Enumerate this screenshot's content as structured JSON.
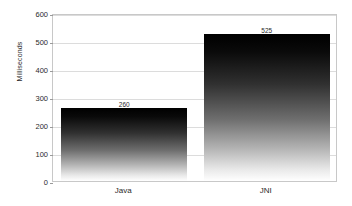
{
  "chart_data": {
    "type": "bar",
    "title": "",
    "subtitle": "",
    "xlabel": "",
    "ylabel": "Milliseconds",
    "categories": [
      "Java",
      "JNI"
    ],
    "values": [
      260,
      525
    ],
    "data_labels": [
      "260",
      "525"
    ],
    "ylim": [
      0,
      600
    ],
    "yticks": [
      0,
      100,
      200,
      300,
      400,
      500,
      600
    ],
    "ytick_labels": [
      "0",
      "100",
      "200",
      "300",
      "400",
      "500",
      "600"
    ],
    "grid": "horizontal",
    "legend": "none",
    "series": [
      {
        "name": "Milliseconds",
        "values": [
          260,
          525
        ]
      }
    ],
    "bar_style": {
      "fill": "vertical-gradient-black-to-white",
      "top_color": "#000000",
      "bottom_color": "#ffffff"
    },
    "colors": {
      "background": "#ffffff",
      "plot_border": "#c8c8c8",
      "gridline": "#dcdcdc",
      "text": "#2b2b2b"
    }
  }
}
